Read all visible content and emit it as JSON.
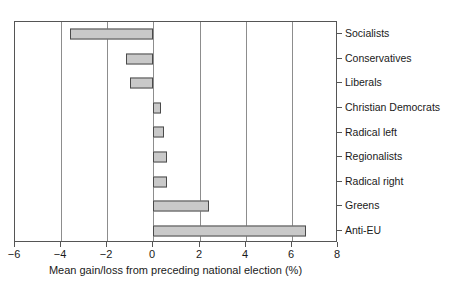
{
  "chart_data": {
    "type": "bar",
    "orientation": "horizontal",
    "title": "",
    "xlabel": "Mean gain/loss from preceding national election (%)",
    "ylabel": "",
    "categories": [
      "Socialists",
      "Conservatives",
      "Liberals",
      "Christian Democrats",
      "Radical left",
      "Regionalists",
      "Radical right",
      "Greens",
      "Anti-EU"
    ],
    "values": [
      -3.6,
      -1.2,
      -1.0,
      0.35,
      0.45,
      0.6,
      0.6,
      2.4,
      6.6
    ],
    "xlim": [
      -6,
      8
    ],
    "xticks": [
      -6,
      -4,
      -2,
      0,
      2,
      4,
      6,
      8
    ],
    "xticklabels": [
      "−6",
      "−4",
      "−2",
      "0",
      "2",
      "4",
      "6",
      "8"
    ],
    "grid": "vertical",
    "legend": "none",
    "bar_fill_color": "#c9c9c9",
    "bar_edge_color": "#4a4a4a",
    "axis_color": "#555555",
    "background_color": "#ffffff"
  }
}
